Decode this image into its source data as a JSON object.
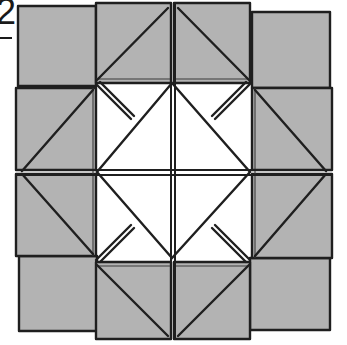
{
  "diagram": {
    "type": "origami-fold-diagram",
    "step": {
      "label": "2"
    },
    "colors": {
      "paper": "#b3b3b3",
      "outline": "#1f1f1f",
      "center": "#ffffff",
      "background": "#ffffff"
    },
    "parts": {
      "corner_squares": [
        {
          "id": "top-left",
          "x": 18,
          "y": 6,
          "w": 78,
          "h": 80
        },
        {
          "id": "top-right",
          "x": 252,
          "y": 12,
          "w": 78,
          "h": 76
        },
        {
          "id": "bottom-left",
          "x": 18,
          "y": 257,
          "w": 78,
          "h": 73
        },
        {
          "id": "bottom-right",
          "x": 250,
          "y": 258,
          "w": 80,
          "h": 72
        }
      ],
      "center_diamond": {
        "top": [
          172,
          83
        ],
        "right": [
          250,
          172
        ],
        "bottom": [
          172,
          258
        ],
        "left": [
          97,
          172
        ]
      }
    }
  }
}
